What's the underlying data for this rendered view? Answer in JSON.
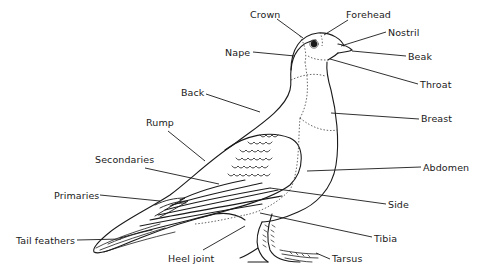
{
  "diagram": {
    "labels": [
      {
        "id": "crown",
        "text": "Crown",
        "x": 10,
        "y": 10
      },
      {
        "id": "forehead",
        "text": "Forehead",
        "x": 346,
        "y": 9
      },
      {
        "id": "nostril",
        "text": "Nostril",
        "x": 388,
        "y": 27
      },
      {
        "id": "nape",
        "text": "Nape",
        "x": 225,
        "y": 45
      },
      {
        "id": "beak",
        "text": "Beak",
        "x": 408,
        "y": 50
      },
      {
        "id": "throat",
        "text": "Throat",
        "x": 420,
        "y": 78
      },
      {
        "id": "back",
        "text": "Back",
        "x": 181,
        "y": 87
      },
      {
        "id": "breast",
        "text": "Breast",
        "x": 421,
        "y": 113
      },
      {
        "id": "rump",
        "text": "Rump",
        "x": 146,
        "y": 117
      },
      {
        "id": "secondaries",
        "text": "Secondaries",
        "x": 95,
        "y": 154
      },
      {
        "id": "abdomen",
        "text": "Abdomen",
        "x": 423,
        "y": 161
      },
      {
        "id": "primaries",
        "text": "Primaries",
        "x": 54,
        "y": 190
      },
      {
        "id": "side",
        "text": "Side",
        "x": 388,
        "y": 199
      },
      {
        "id": "tail-feathers",
        "text": "Tail feathers",
        "x": 16,
        "y": 235
      },
      {
        "id": "tibia",
        "text": "Tibia",
        "x": 374,
        "y": 233
      },
      {
        "id": "heel-joint",
        "text": "Heel joint",
        "x": 168,
        "y": 253
      },
      {
        "id": "tarsus",
        "text": "Tarsus",
        "x": 332,
        "y": 253
      }
    ],
    "colors": {
      "ink": "#1a1a1a",
      "background": "#ffffff",
      "dotted": "#555555"
    }
  }
}
